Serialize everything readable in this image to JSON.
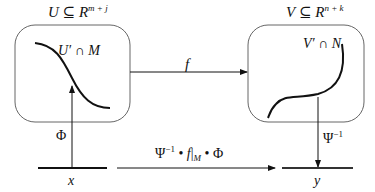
{
  "diagram": {
    "left_domain": {
      "set": "U",
      "relation": "⊆",
      "space": "R",
      "exponent": "m + j",
      "submanifold_label": {
        "set": "U′",
        "op": "∩",
        "manifold": "M"
      }
    },
    "right_domain": {
      "set": "V",
      "relation": "⊆",
      "space": "R",
      "exponent": "n + k",
      "submanifold_label": {
        "set": "V′",
        "op": "∩",
        "manifold": "N"
      }
    },
    "top_map": {
      "label": "f"
    },
    "left_chart": {
      "label": "Φ"
    },
    "right_chart": {
      "label": "Ψ",
      "exponent": "−1"
    },
    "bottom_map": {
      "psi": "Ψ",
      "psi_exp": "−1",
      "dot1": "•",
      "f": "f",
      "restriction": "|",
      "sub": "M",
      "dot2": "•",
      "phi": "Φ"
    },
    "left_point": {
      "label": "x"
    },
    "right_point": {
      "label": "y"
    },
    "colors": {
      "stroke": "#111111",
      "box": "#555555",
      "background": "#ffffff"
    }
  }
}
